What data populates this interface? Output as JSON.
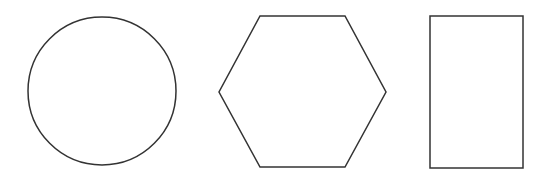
{
  "canvas": {
    "width": 549,
    "height": 184,
    "background": "#ffffff",
    "stroke_color": "#333333"
  },
  "shapes": [
    {
      "type": "circle",
      "label": "circle",
      "cx": 102,
      "cy": 91,
      "r": 74
    },
    {
      "type": "hexagon",
      "label": "hexagon",
      "points": "260,16 345,16 386,92 345,167 260,167 219,92"
    },
    {
      "type": "rectangle",
      "label": "rectangle",
      "x": 430,
      "y": 16,
      "width": 93,
      "height": 152
    }
  ]
}
